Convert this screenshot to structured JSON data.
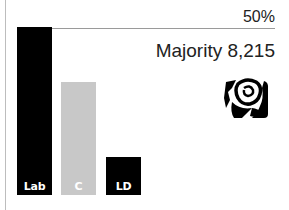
{
  "chart_data": {
    "type": "bar",
    "title": "",
    "categories": [
      "Lab",
      "C",
      "LD"
    ],
    "values": [
      50.3,
      33.8,
      11.4
    ],
    "colors": [
      "#000000",
      "#c8c8c8",
      "#000000"
    ],
    "reference_line": {
      "value": 50,
      "label": "50%"
    },
    "annotation": "Majority 8,215",
    "xlabel": "",
    "ylabel": "",
    "ylim": [
      0,
      50
    ],
    "grid": false,
    "winner_icon": "labour-rose-icon"
  },
  "labels": {
    "half_line": "50%",
    "majority": "Majority 8,215",
    "bars": [
      "Lab",
      "C",
      "LD"
    ]
  },
  "layout": {
    "bar_lefts": [
      17,
      61,
      106
    ],
    "bottom_px": 195,
    "half_px": 167
  }
}
